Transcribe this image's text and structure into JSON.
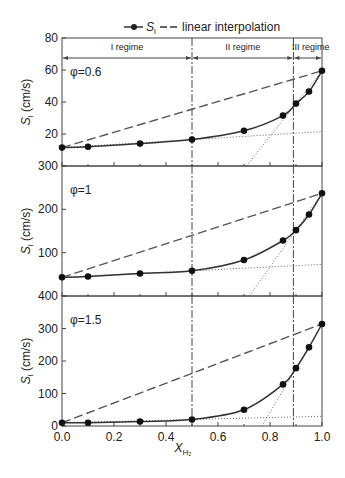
{
  "chart_data": {
    "type": "line",
    "legend": {
      "series_label": "S_l",
      "interp_label": "linear interpolation",
      "position": "top"
    },
    "xlabel": "X_H2",
    "x_ticks": [
      "0.0",
      "0.2",
      "0.4",
      "0.6",
      "0.8",
      "1.0"
    ],
    "x": [
      0.0,
      0.1,
      0.3,
      0.5,
      0.7,
      0.85,
      0.9,
      0.95,
      1.0
    ],
    "regimes": [
      {
        "label": "I regime",
        "from": 0.0,
        "to": 0.5
      },
      {
        "label": "II regime",
        "from": 0.5,
        "to": 0.89
      },
      {
        "label": "III regime",
        "from": 0.89,
        "to": 1.0
      }
    ],
    "regime_boundaries": [
      0.5,
      0.89
    ],
    "panels": [
      {
        "label": "φ=0.6",
        "ylabel": "S_l (cm/s)",
        "ylim": [
          0,
          80
        ],
        "y_ticks": [
          "20",
          "40",
          "60",
          "80"
        ],
        "values": [
          11.5,
          12,
          14,
          16.5,
          22,
          31.5,
          39,
          46.5,
          59.5
        ]
      },
      {
        "label": "φ=1",
        "ylabel": "S_l (cm/s)",
        "ylim": [
          0,
          300
        ],
        "y_ticks": [
          "100",
          "200",
          "300"
        ],
        "values": [
          43,
          45,
          52,
          58,
          83,
          128,
          152,
          188,
          237
        ]
      },
      {
        "label": "φ=1.5",
        "ylabel": "S_l (cm/s)",
        "ylim": [
          0,
          400
        ],
        "y_ticks": [
          "0",
          "100",
          "200",
          "300",
          "400"
        ],
        "values": [
          10,
          10,
          14,
          20,
          50,
          128,
          178,
          242,
          314
        ]
      }
    ]
  }
}
